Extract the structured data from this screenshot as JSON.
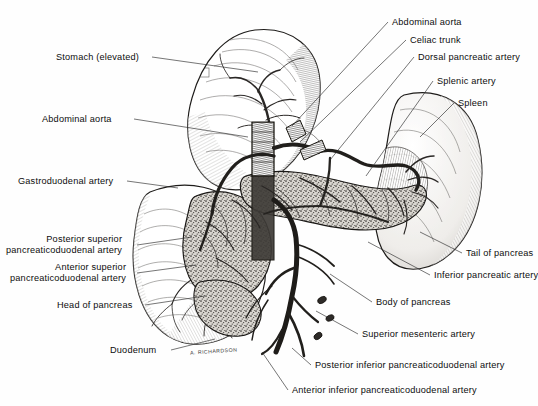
{
  "figure": {
    "signature": "A. RICHARDSON",
    "background_color": "#fefefe",
    "ink_color": "#1a1a1a",
    "leader_color": "#2b2b2b"
  },
  "labels": {
    "left": [
      {
        "id": "stomach-elevated",
        "text": "Stomach (elevated)",
        "x": 56,
        "y": 52,
        "align": "right",
        "leader": "M 152 57 L 258 72"
      },
      {
        "id": "abdominal-aorta-left",
        "text": "Abdominal aorta",
        "x": 42,
        "y": 114,
        "align": "right",
        "leader": "M 134 119 L 248 137"
      },
      {
        "id": "gastroduodenal-artery",
        "text": "Gastroduodenal artery",
        "x": 18,
        "y": 176,
        "align": "right",
        "leader": "M 127 181 L 178 188"
      },
      {
        "id": "posterior-superior-pancreaticoduodenal-artery",
        "line1": "Posterior superior",
        "line2": "pancreaticoduodenal artery",
        "x": 6,
        "y": 234,
        "align": "right",
        "leader": "M 137 245 L 192 237"
      },
      {
        "id": "anterior-superior-pancreaticoduodenal-artery",
        "line1": "Anterior superior",
        "line2": "pancreaticoduodenal artery",
        "x": 10,
        "y": 262,
        "align": "right",
        "leader": "M 137 273 L 196 265"
      },
      {
        "id": "head-of-pancreas",
        "text": "Head of pancreas",
        "x": 57,
        "y": 300,
        "align": "right",
        "leader": "M 145 305 L 205 296"
      },
      {
        "id": "duodenum",
        "text": "Duodenum",
        "x": 110,
        "y": 345,
        "align": "right",
        "leader": "M 171 350 L 215 339"
      }
    ],
    "right": [
      {
        "id": "abdominal-aorta-right",
        "text": "Abdominal aorta",
        "x": 392,
        "y": 17,
        "align": "left",
        "leader": "M 388 22 L 292 126"
      },
      {
        "id": "celiac-trunk",
        "text": "Celiac trunk",
        "x": 410,
        "y": 35,
        "align": "left",
        "leader": "M 406 40 L 300 142"
      },
      {
        "id": "dorsal-pancreatic-artery",
        "text": "Dorsal pancreatic artery",
        "x": 418,
        "y": 52,
        "align": "left",
        "leader": "M 414 57 L 330 160"
      },
      {
        "id": "splenic-artery",
        "text": "Splenic artery",
        "x": 437,
        "y": 76,
        "align": "left",
        "leader": "M 433 81 L 366 176"
      },
      {
        "id": "spleen",
        "text": "Spleen",
        "x": 458,
        "y": 98,
        "align": "left",
        "leader": "M 454 103 L 420 137"
      },
      {
        "id": "tail-of-pancreas",
        "text": "Tail of pancreas",
        "x": 466,
        "y": 248,
        "align": "left",
        "leader": "M 462 253 L 420 232"
      },
      {
        "id": "inferior-pancreatic-artery",
        "text": "Inferior pancreatic artery",
        "x": 434,
        "y": 270,
        "align": "left",
        "leader": "M 430 275 L 368 242"
      },
      {
        "id": "body-of-pancreas",
        "text": "Body of pancreas",
        "x": 376,
        "y": 297,
        "align": "left",
        "leader": "M 372 302 L 330 274"
      },
      {
        "id": "superior-mesenteric-artery",
        "text": "Superior mesenteric artery",
        "x": 362,
        "y": 329,
        "align": "left",
        "leader": "M 358 334 L 316 311"
      },
      {
        "id": "posterior-inferior-pancreaticoduodenal-artery",
        "text": "Posterior inferior pancreaticoduodenal artery",
        "x": 315,
        "y": 360,
        "align": "left",
        "leader": "M 311 365 L 292 348"
      },
      {
        "id": "anterior-inferior-pancreaticoduodenal-artery",
        "text": "Anterior inferior pancreaticoduodenal artery",
        "x": 292,
        "y": 385,
        "align": "left",
        "leader": "M 288 390 L 262 352"
      }
    ]
  },
  "structures": {
    "stomach": "stomach-elevated-outline",
    "spleen": "spleen-outline",
    "pancreas": "pancreas-stippled-body",
    "duodenum": "duodenal-loop",
    "vessels": "arterial-tree"
  }
}
